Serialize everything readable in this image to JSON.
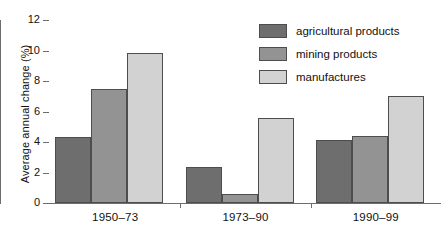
{
  "chart_data": {
    "type": "bar",
    "title": "",
    "xlabel": "",
    "ylabel": "Average annual change (%)",
    "categories": [
      "1950–73",
      "1973–90",
      "1990–99"
    ],
    "series": [
      {
        "name": "agricultural products",
        "color": "#6e6e6e",
        "values": [
          4.35,
          2.35,
          4.1
        ]
      },
      {
        "name": "mining products",
        "color": "#939393",
        "values": [
          7.5,
          0.6,
          4.4
        ]
      },
      {
        "name": "manufactures",
        "color": "#d2d2d2",
        "values": [
          9.85,
          5.55,
          7.0
        ]
      }
    ],
    "ylim": [
      0,
      12
    ],
    "yticks": [
      0,
      2,
      4,
      6,
      8,
      10,
      12
    ],
    "ytick_labels": [
      "0",
      "2",
      "4",
      "6",
      "8",
      "10",
      "12"
    ],
    "grid": false,
    "legend_position": "top-right"
  },
  "legend": {
    "items": [
      {
        "label": "agricultural products",
        "color": "#6e6e6e"
      },
      {
        "label": "mining products",
        "color": "#939393"
      },
      {
        "label": "manufactures",
        "color": "#d2d2d2"
      }
    ]
  },
  "axes": {
    "y_title": "Average annual change (%)",
    "y_tick_labels": [
      "12",
      "10",
      "8",
      "6",
      "4",
      "2",
      "0"
    ],
    "x_tick_labels": [
      "1950–73",
      "1973–90",
      "1990–99"
    ]
  },
  "colors": {
    "axis": "#6d6d6d",
    "bar_border": "#4d4d4d",
    "text": "#111111",
    "background": "#ffffff"
  }
}
